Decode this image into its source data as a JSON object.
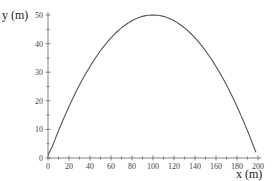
{
  "chart_data": {
    "type": "line",
    "title": "",
    "xlabel": "x (m)",
    "ylabel": "y (m)",
    "xlim": [
      0,
      200
    ],
    "ylim": [
      0,
      50
    ],
    "grid": false,
    "legend": null,
    "x_ticks": [
      0,
      20,
      40,
      60,
      80,
      100,
      120,
      140,
      160,
      180,
      200
    ],
    "y_ticks": [
      0,
      10,
      20,
      30,
      40,
      50
    ],
    "series": [
      {
        "name": "trajectory",
        "color": "#555555",
        "x": [
          0,
          10,
          20,
          30,
          40,
          50,
          60,
          70,
          80,
          90,
          100,
          110,
          120,
          130,
          140,
          150,
          160,
          170,
          180,
          190,
          198
        ],
        "y": [
          1,
          9.5,
          18,
          25.5,
          32,
          37.5,
          42,
          45.5,
          48,
          49.5,
          50,
          49.5,
          48,
          45.5,
          42,
          37.5,
          32,
          25.5,
          18,
          9.5,
          1
        ]
      }
    ]
  }
}
